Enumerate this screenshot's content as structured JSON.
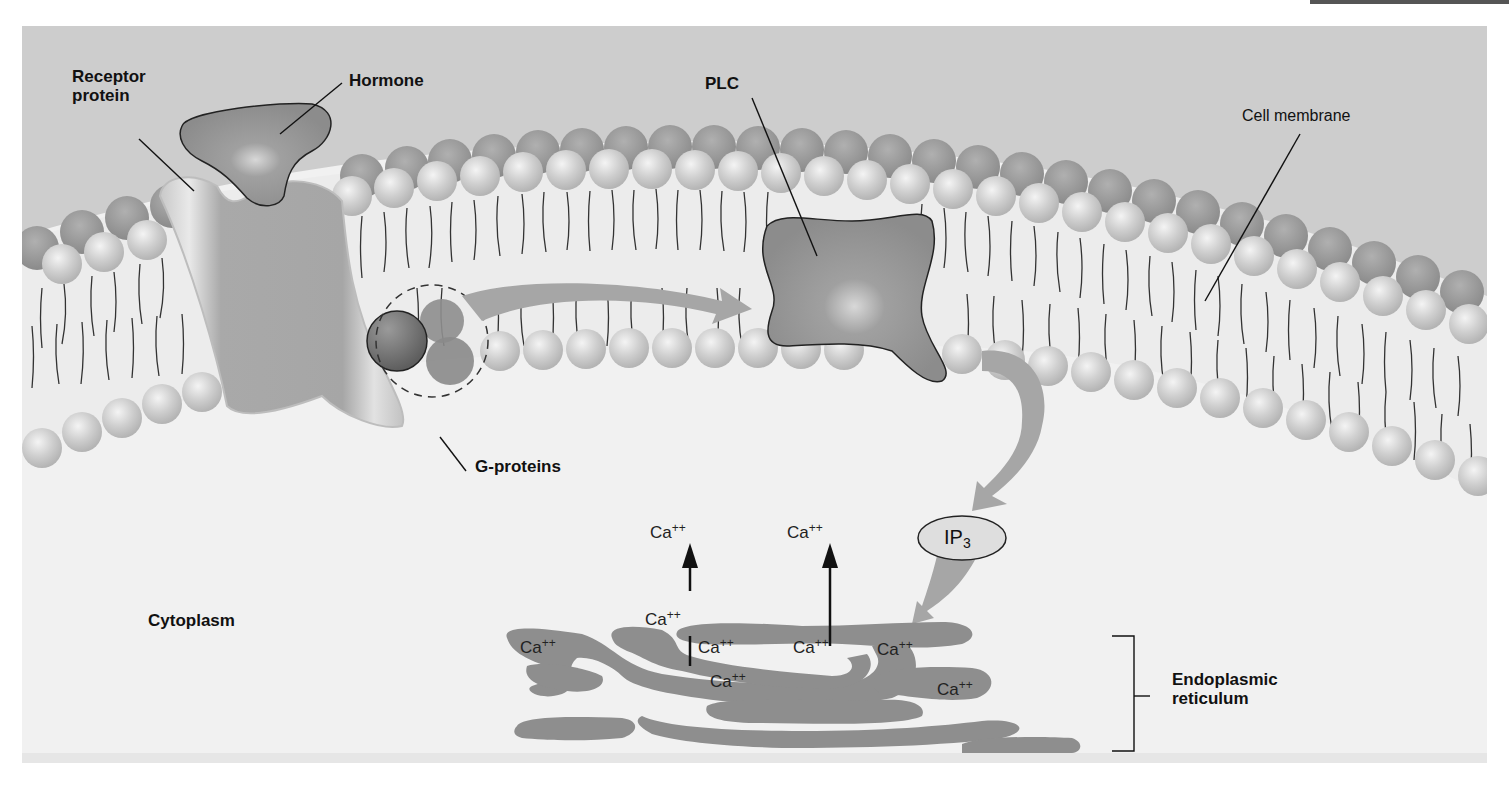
{
  "figure": {
    "title_labels": {
      "receptor": "Receptor protein",
      "receptor_line1": "Receptor",
      "receptor_line2": "protein",
      "hormone": "Hormone",
      "plc": "PLC",
      "cell_membrane": "Cell membrane",
      "g_proteins": "G-proteins",
      "cytoplasm": "Cytoplasm",
      "er_line1": "Endoplasmic",
      "er_line2": "reticulum",
      "ip3_base": "IP",
      "ip3_sub": "3"
    },
    "calcium": {
      "base": "Ca",
      "charge": "++",
      "released": [
        {
          "id": "released-left",
          "x": 628,
          "y": 495
        },
        {
          "id": "released-right",
          "x": 765,
          "y": 495
        }
      ],
      "inside_er": [
        {
          "id": "er-ca-1",
          "x": 498,
          "y": 610
        },
        {
          "id": "er-ca-2",
          "x": 623,
          "y": 582
        },
        {
          "id": "er-ca-3",
          "x": 676,
          "y": 610
        },
        {
          "id": "er-ca-4",
          "x": 771,
          "y": 610
        },
        {
          "id": "er-ca-5",
          "x": 855,
          "y": 612
        },
        {
          "id": "er-ca-6",
          "x": 688,
          "y": 644
        },
        {
          "id": "er-ca-7",
          "x": 915,
          "y": 652
        }
      ]
    },
    "colors": {
      "background": "#f1f1f1",
      "extracellular": "#cfcfcf",
      "head_light": "#cdcdcd",
      "head_dark": "#9a9a9a",
      "protein": "#8f8f8f",
      "er": "#8e8e8e",
      "arrow": "#a8a8a8",
      "gprotein_dark": "#6c6c6c",
      "line": "#111111"
    }
  }
}
